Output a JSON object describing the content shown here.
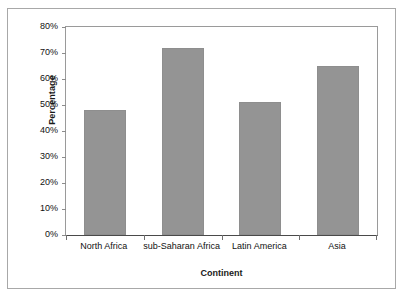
{
  "chart_data": {
    "type": "bar",
    "title": "",
    "xlabel": "Continent",
    "ylabel": "Percentage",
    "categories": [
      "North Africa",
      "sub-Saharan Africa",
      "Latin America",
      "Asia"
    ],
    "values": [
      48,
      72,
      51,
      65
    ],
    "ylim": [
      0,
      80
    ],
    "ytick_values": [
      80,
      70,
      60,
      50,
      40,
      30,
      20,
      10,
      0
    ],
    "ytick_labels": [
      "80%",
      "70%",
      "60%",
      "50%",
      "40%",
      "30%",
      "20%",
      "10%",
      "0%"
    ],
    "grid": false,
    "legend": false,
    "bar_color": "#949494",
    "axis_color": "#8c8c8c",
    "frame_color": "#a8a8a8",
    "text_color": "#111111"
  }
}
